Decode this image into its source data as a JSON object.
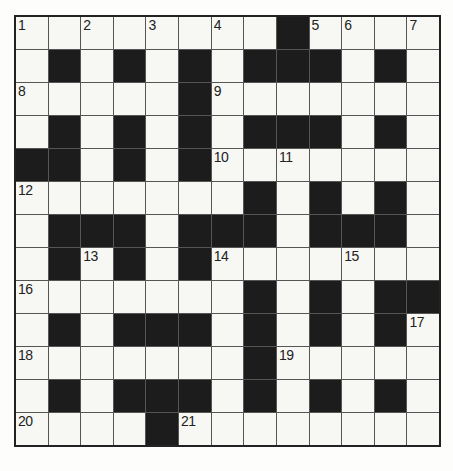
{
  "puzzle": {
    "kind": "crossword-grid",
    "rows": 13,
    "cols": 13,
    "layout": [
      "........#....",
      ".#.#.#.###.#.",
      ".....#.......",
      ".#.#.#.###.#.",
      "##.#.#.......",
      ".......#.#.#.",
      ".###.###.###.",
      ".#.#.#.......",
      ".......#.#.##",
      ".#.###.#.#.#.",
      ".......#.....",
      ".#.###.#.#.#.",
      "....#........"
    ],
    "numbers": [
      {
        "row": 1,
        "col": 1,
        "label": "1"
      },
      {
        "row": 1,
        "col": 3,
        "label": "2"
      },
      {
        "row": 1,
        "col": 5,
        "label": "3"
      },
      {
        "row": 1,
        "col": 7,
        "label": "4"
      },
      {
        "row": 1,
        "col": 10,
        "label": "5"
      },
      {
        "row": 1,
        "col": 11,
        "label": "6"
      },
      {
        "row": 1,
        "col": 13,
        "label": "7"
      },
      {
        "row": 3,
        "col": 1,
        "label": "8"
      },
      {
        "row": 3,
        "col": 7,
        "label": "9"
      },
      {
        "row": 5,
        "col": 7,
        "label": "10"
      },
      {
        "row": 5,
        "col": 9,
        "label": "11"
      },
      {
        "row": 6,
        "col": 1,
        "label": "12"
      },
      {
        "row": 8,
        "col": 3,
        "label": "13"
      },
      {
        "row": 8,
        "col": 7,
        "label": "14"
      },
      {
        "row": 8,
        "col": 11,
        "label": "15"
      },
      {
        "row": 9,
        "col": 1,
        "label": "16"
      },
      {
        "row": 10,
        "col": 13,
        "label": "17"
      },
      {
        "row": 11,
        "col": 1,
        "label": "18"
      },
      {
        "row": 11,
        "col": 9,
        "label": "19"
      },
      {
        "row": 13,
        "col": 1,
        "label": "20"
      },
      {
        "row": 13,
        "col": 6,
        "label": "21"
      }
    ],
    "colors": {
      "white_cell": "#f7f7f4",
      "black_cell": "#1c1c1c",
      "grid_line": "#555555",
      "outer_border": "#222222",
      "number_color": "#222222",
      "page_background": "#fdfdfc"
    }
  }
}
